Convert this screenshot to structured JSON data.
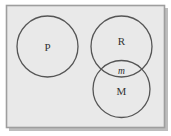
{
  "figure": {
    "kind": "venn-diagram",
    "universe": {
      "name": "universal-set-rectangle",
      "fill_color": "#e9e9e9",
      "border_color": "#9a9a9a",
      "shadow_color": "#b8b8b8",
      "x": 6,
      "y": 5,
      "width": 159,
      "height": 123
    },
    "background_color": "#ffffff",
    "stroke_color": "#555555",
    "circles": [
      {
        "id": "circle-p",
        "label": "P",
        "label_style": "upright",
        "cx": 47.5,
        "cy": 46.5,
        "r": 30.5,
        "label_x": 47.5,
        "label_y": 50.5
      },
      {
        "id": "circle-r",
        "label": "R",
        "label_style": "upright",
        "cx": 121.5,
        "cy": 46.5,
        "r": 30.5,
        "label_x": 121.5,
        "label_y": 44.5
      },
      {
        "id": "circle-m",
        "label": "M",
        "label_style": "upright",
        "cx": 121.5,
        "cy": 89.0,
        "r": 28.5,
        "label_x": 121.5,
        "label_y": 95.0
      }
    ],
    "intersection": {
      "id": "region-r-and-m",
      "label": "m",
      "label_style": "italic",
      "label_x": 121.5,
      "label_y": 73.5
    }
  }
}
